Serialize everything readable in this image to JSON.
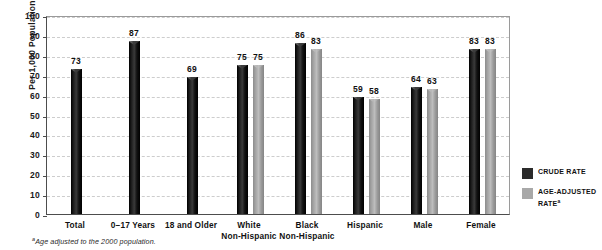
{
  "top_sliver": "HEALTH, UNITED STATES",
  "chart_data": {
    "type": "bar",
    "title": "",
    "xlabel": "",
    "ylabel": "Per 1,000 Population",
    "ylim": [
      0,
      100
    ],
    "ytick_step": 10,
    "yticks": [
      100,
      90,
      80,
      70,
      60,
      50,
      40,
      30,
      20,
      10,
      0
    ],
    "grid": true,
    "legend_position": "right",
    "categories": [
      "Total",
      "0–17 Years",
      "18 and Older",
      "White\nNon-Hispanic",
      "Black\nNon-Hispanic",
      "Hispanic",
      "Male",
      "Female"
    ],
    "category_lines": [
      [
        "Total"
      ],
      [
        "0–17 Years"
      ],
      [
        "18 and Older"
      ],
      [
        "White",
        "Non-Hispanic"
      ],
      [
        "Black",
        "Non-Hispanic"
      ],
      [
        "Hispanic"
      ],
      [
        "Male"
      ],
      [
        "Female"
      ]
    ],
    "series": [
      {
        "name": "CRUDE RATE",
        "color": "#1d1d1d",
        "values": [
          73,
          87,
          69,
          75,
          86,
          59,
          64,
          83
        ]
      },
      {
        "name": "AGE-ADJUSTED RATE",
        "color": "#a8a8a8",
        "values": [
          null,
          null,
          null,
          75,
          83,
          58,
          63,
          83
        ]
      }
    ]
  },
  "legend": {
    "items": [
      {
        "label": "CRUDE RATE",
        "superscript": "",
        "swatch": "#2b2b2b"
      },
      {
        "label": "AGE-ADJUSTED RATE",
        "superscript": "a",
        "swatch": "#a8a8a8"
      }
    ]
  },
  "footnote": {
    "marker": "a",
    "text": "Age adjusted to the 2000 population."
  }
}
